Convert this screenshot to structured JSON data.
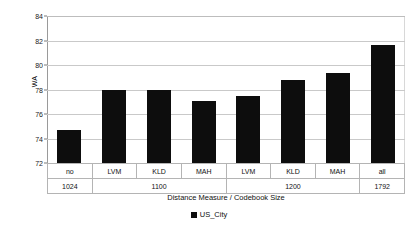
{
  "chart_data": {
    "type": "bar",
    "title": "",
    "xlabel": "Distance Measure / Codebook Size",
    "ylabel": "WA",
    "ylim": [
      72,
      84
    ],
    "ytick_step": 2,
    "yticks": [
      84,
      82,
      80,
      78,
      76,
      74,
      72
    ],
    "grid": true,
    "legend_position": "bottom",
    "categories": [
      "no",
      "LVM",
      "KLD",
      "MAH",
      "LVM",
      "KLD",
      "MAH",
      "all"
    ],
    "group_labels": [
      "1024",
      "1100",
      "1200",
      "1792"
    ],
    "group_spans": [
      1,
      3,
      3,
      1
    ],
    "series": [
      {
        "name": "US_City",
        "color": "#0d0d0d",
        "values": [
          74.7,
          78.0,
          78.0,
          77.05,
          77.5,
          78.75,
          79.35,
          81.65
        ]
      }
    ]
  },
  "legend": {
    "entries": [
      {
        "label": "US_City"
      }
    ]
  }
}
